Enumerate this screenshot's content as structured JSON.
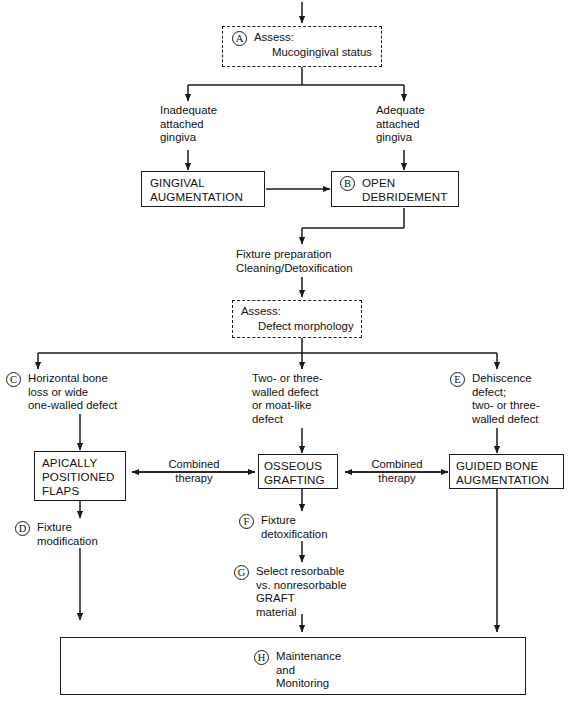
{
  "diagram": {
    "corner_mark": "",
    "nodes": {
      "assess_mucogingival": {
        "badge": "A",
        "line1": "Assess:",
        "line2": "Mucogingival status",
        "shape": "dashed-box"
      },
      "inadequate": {
        "text": "Inadequate\nattached\ngingiva",
        "shape": "plain-text"
      },
      "adequate": {
        "text": "Adequate\nattached\ngingiva",
        "shape": "plain-text"
      },
      "gingival_augmentation": {
        "text": "GINGIVAL\nAUGMENTATION",
        "shape": "solid-box"
      },
      "open_debridement": {
        "badge": "B",
        "text": "OPEN\nDEBRIDEMENT",
        "shape": "solid-box"
      },
      "fixture_preparation": {
        "text": "Fixture preparation\nCleaning/Detoxification",
        "shape": "plain-text"
      },
      "assess_defect": {
        "line1": "Assess:",
        "line2": "Defect morphology",
        "shape": "dashed-box"
      },
      "horizontal_bone_loss": {
        "badge": "C",
        "text": "Horizontal bone\nloss or wide\none-walled defect",
        "shape": "plain-text"
      },
      "two_three_walled": {
        "text": "Two- or three-\nwalled defect\nor moat-like\ndefect",
        "shape": "plain-text"
      },
      "dehiscence": {
        "badge": "E",
        "text": "Dehiscence\ndefect;\ntwo- or three-\nwalled defect",
        "shape": "plain-text"
      },
      "apically_positioned_flaps": {
        "text": "APICALLY\nPOSITIONED\nFLAPS",
        "shape": "solid-box"
      },
      "osseous_grafting": {
        "text": "OSSEOUS\nGRAFTING",
        "shape": "solid-box"
      },
      "guided_bone_augmentation": {
        "text": "GUIDED BONE\nAUGMENTATION",
        "shape": "solid-box"
      },
      "fixture_modification": {
        "badge": "D",
        "text": "Fixture\nmodification",
        "shape": "plain-text"
      },
      "fixture_detoxification": {
        "badge": "F",
        "text": "Fixture\ndetoxification",
        "shape": "plain-text"
      },
      "select_graft": {
        "badge": "G",
        "text": "Select resorbable\nvs. nonresorbable\nGRAFT\nmaterial",
        "shape": "plain-text"
      },
      "maintenance": {
        "badge": "H",
        "text": "Maintenance\nand\nMonitoring",
        "shape": "solid-box"
      }
    },
    "edge_labels": {
      "combined_left": "Combined\ntherapy",
      "combined_right": "Combined\ntherapy"
    },
    "colors": {
      "stroke": "#1a1a1a",
      "background": "#ffffff",
      "text": "#111111"
    }
  }
}
